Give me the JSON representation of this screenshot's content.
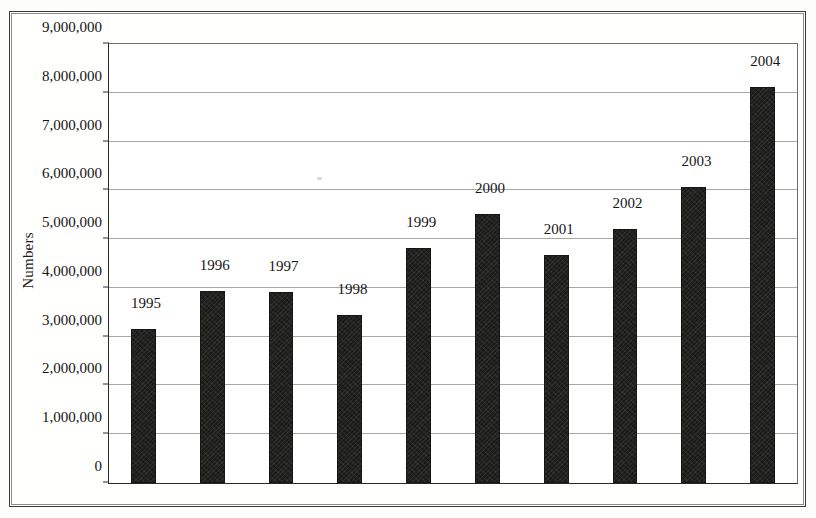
{
  "chart_data": {
    "type": "bar",
    "title": "",
    "subtitle": "",
    "xlabel": "",
    "ylabel": "Numbers",
    "categories": [
      "1995",
      "1996",
      "1997",
      "1998",
      "1999",
      "2000",
      "2001",
      "2002",
      "2003",
      "2004"
    ],
    "values": [
      3150000,
      3930000,
      3920000,
      3450000,
      4820000,
      5520000,
      4670000,
      5210000,
      6060000,
      8120000
    ],
    "data_labels": [
      "1995",
      "1996",
      "1997",
      "1998",
      "1999",
      "2000",
      "2001",
      "2002",
      "2003",
      "2004"
    ],
    "ylim": [
      0,
      9000000
    ],
    "ytick_values": [
      0,
      1000000,
      2000000,
      3000000,
      4000000,
      5000000,
      6000000,
      7000000,
      8000000,
      9000000
    ],
    "ytick_labels": [
      "0",
      "1,000,000",
      "2,000,000",
      "3,000,000",
      "4,000,000",
      "5,000,000",
      "6,000,000",
      "7,000,000",
      "8,000,000",
      "9,000,000"
    ],
    "grid": true,
    "grid_axis": "y",
    "legend": false,
    "legend_position": "none",
    "bar_color": "#1c1c1a",
    "grid_color": "#a7a7a3",
    "axis_color": "#2a2a28",
    "background_color": "#ffffff",
    "annotations": [
      "Bar value labels show the year above each bar",
      "No x-axis tick labels are drawn"
    ]
  },
  "figure": {
    "frame_color": "#3a3a38",
    "outer_border": true
  }
}
